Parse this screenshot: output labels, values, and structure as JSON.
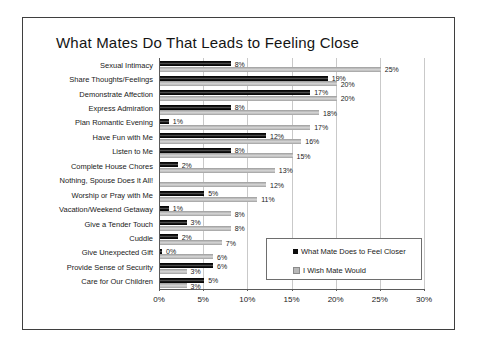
{
  "window": {
    "background": "#ffffff",
    "frame_border_color": "#3f3f3f"
  },
  "chart_data": {
    "type": "bar",
    "orientation": "horizontal",
    "title": "What Mates Do That Leads to Feeling Close",
    "categories": [
      "Sexual Intimacy",
      "Share Thoughts/Feelings",
      "Demonstrate Affection",
      "Express Admiration",
      "Plan Romantic Evening",
      "Have Fun with Me",
      "Listen to Me",
      "Complete House Chores",
      "Nothing, Spouse Does It All!",
      "Worship or Pray with Me",
      "Vacation/Weekend Getaway",
      "Give a Tender Touch",
      "Cuddle",
      "Give Unexpected Gift",
      "Provide Sense of Security",
      "Care for Our Children"
    ],
    "series": [
      {
        "name": "What Mate Does to Feel Closer",
        "color": "#141414",
        "values": [
          8,
          19,
          17,
          8,
          1,
          12,
          8,
          2,
          null,
          5,
          1,
          3,
          2,
          0,
          6,
          5
        ],
        "labels": [
          "8%",
          "19%",
          "17%",
          "8%",
          "1%",
          "12%",
          "8%",
          "2%",
          "",
          "5%",
          "1%",
          "3%",
          "2%",
          "0%",
          "6%",
          "5%"
        ]
      },
      {
        "name": "I Wish Mate Would",
        "color": "#b8b8b8",
        "values": [
          25,
          20,
          20,
          18,
          17,
          16,
          15,
          13,
          12,
          11,
          8,
          8,
          7,
          6,
          3,
          3
        ],
        "labels": [
          "25%",
          "20%",
          "20%",
          "18%",
          "17%",
          "16%",
          "15%",
          "13%",
          "12%",
          "11%",
          "8%",
          "8%",
          "7%",
          "6%",
          "3%",
          "3%"
        ]
      }
    ],
    "xlim": [
      0,
      30
    ],
    "x_ticks": [
      "0%",
      "5%",
      "10%",
      "15%",
      "20%",
      "25%",
      "30%"
    ],
    "grid": true,
    "gridline_color": "#c9c9c9",
    "legend_position": "inside-bottom-right"
  }
}
